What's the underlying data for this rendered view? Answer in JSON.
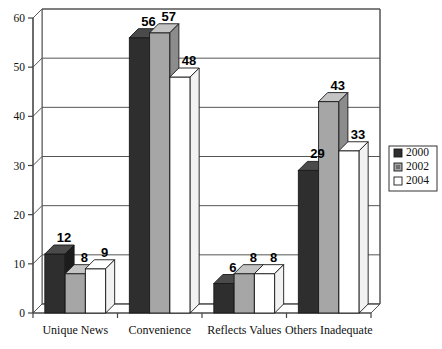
{
  "chart_data": {
    "type": "bar",
    "title": "",
    "subtitle": "",
    "xlabel": "",
    "ylabel": "",
    "categories": [
      "Unique News",
      "Convenience",
      "Reflects Values",
      "Others Inadequate"
    ],
    "series": [
      {
        "name": "2000",
        "values": [
          12,
          56,
          6,
          29
        ],
        "color": "#2e2e2e"
      },
      {
        "name": "2002",
        "values": [
          8,
          57,
          8,
          43
        ],
        "color": "#a6a6a6"
      },
      {
        "name": "2004",
        "values": [
          9,
          48,
          8,
          33
        ],
        "color": "#ffffff"
      }
    ],
    "ylim": [
      0,
      60
    ],
    "yticks": [
      0,
      10,
      20,
      30,
      40,
      50,
      60
    ],
    "ytick_labels": [
      "0",
      "10",
      "20",
      "30",
      "40",
      "50",
      "60"
    ],
    "grid": true,
    "legend_position": "right",
    "data_labels": true,
    "style": "3d-column"
  },
  "legend": {
    "entries": [
      {
        "label": "2000",
        "swatch": "#2e2e2e"
      },
      {
        "label": "2002",
        "swatch": "#a6a6a6"
      },
      {
        "label": "2004",
        "swatch": "#ffffff"
      }
    ]
  },
  "colors": {
    "series_2000": "#2e2e2e",
    "series_2002": "#a6a6a6",
    "series_2004": "#ffffff",
    "outline": "#1a1a1a",
    "grid": "#555555",
    "background": "#ffffff",
    "text": "#111111"
  }
}
